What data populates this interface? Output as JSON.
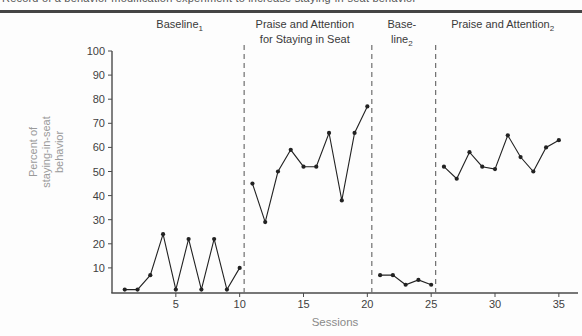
{
  "page": {
    "caption_fragment": "Record of a behavior modification experiment to increase staying-in-seat behavior",
    "background": "#fdfdfd"
  },
  "colors": {
    "data": "#222222",
    "axis": "#4a4a4a",
    "tick_label": "#3f3f3f",
    "phase_label": "#3a3a3a",
    "dashed_line": "#6e6e6e",
    "ylabel": "#9a9a9a",
    "xlabel": "#8a8a8a",
    "top_rule": "#454545"
  },
  "chart_data": {
    "type": "line",
    "title": "",
    "xlabel": "Sessions",
    "ylabel": "Percent of staying-in-seat behavior",
    "ylabel_lines": [
      "Percent of",
      "staying-in-seat",
      "behavior"
    ],
    "xlim": [
      0,
      36.5
    ],
    "ylim": [
      0,
      100
    ],
    "xticks": [
      5,
      10,
      15,
      20,
      25,
      30,
      35
    ],
    "yticks": [
      10,
      20,
      30,
      40,
      50,
      60,
      70,
      80,
      90,
      100
    ],
    "grid": false,
    "legend": "none",
    "marker": "dot",
    "phase_boundaries_sessions": [
      10.35,
      20.35,
      25.35
    ],
    "phases": [
      {
        "name": "Baseline 1",
        "label_lines": [
          {
            "text": "Baseline",
            "sub": "1"
          }
        ],
        "label_center_session": 5.3,
        "sessions": [
          1,
          2,
          3,
          4,
          5,
          6,
          7,
          8,
          9,
          10
        ],
        "values": [
          1,
          1,
          7,
          24,
          1,
          22,
          1,
          22,
          1,
          10
        ]
      },
      {
        "name": "Praise and Attention for Staying in Seat",
        "label_lines": [
          {
            "text": "Praise and Attention"
          },
          {
            "text": "for Staying in Seat"
          }
        ],
        "label_center_session": 15.1,
        "sessions": [
          11,
          12,
          13,
          14,
          15,
          16,
          17,
          18,
          19,
          20
        ],
        "values": [
          45,
          29,
          50,
          59,
          52,
          52,
          66,
          38,
          66,
          77
        ]
      },
      {
        "name": "Baseline 2",
        "label_lines": [
          {
            "text": "Base-"
          },
          {
            "text": "line",
            "sub": "2"
          }
        ],
        "label_center_session": 22.7,
        "sessions": [
          21,
          22,
          23,
          24,
          25
        ],
        "values": [
          7,
          7,
          3,
          5,
          3
        ]
      },
      {
        "name": "Praise and Attention 2",
        "label_lines": [
          {
            "text": "Praise and Attention",
            "sub": "2"
          }
        ],
        "label_center_session": 30.6,
        "sessions": [
          26,
          27,
          28,
          29,
          30,
          31,
          32,
          33,
          34,
          35
        ],
        "values": [
          52,
          47,
          58,
          52,
          51,
          65,
          56,
          50,
          60,
          63
        ]
      }
    ],
    "layout": {
      "plot_left": 112,
      "plot_right": 578,
      "plot_top": 51,
      "plot_bottom": 292,
      "axis_bottom": 293,
      "dash_top": 45,
      "label_line1_y": 28,
      "label_line2_y": 43,
      "xtick_label_y": 308,
      "xlabel_y": 326,
      "xlabel_center_session": 17.5,
      "ylabel_x": 50,
      "ylabel_y": 152
    }
  }
}
